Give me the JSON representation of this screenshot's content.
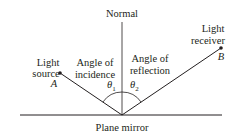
{
  "diagram": {
    "normal_label": "Normal",
    "mirror_label": "Plane mirror",
    "source_label_line1": "Light",
    "source_label_line2": "source",
    "receiver_label_line1": "Light",
    "receiver_label_line2": "receiver",
    "incidence_label_line1": "Angle of",
    "incidence_label_line2": "incidence",
    "reflection_label_line1": "Angle of",
    "reflection_label_line2": "reflection",
    "point_a": "A",
    "point_b": "B",
    "theta1": "θ",
    "theta1_sub": "1",
    "theta2": "θ",
    "theta2_sub": "2",
    "line_color": "#231f20"
  }
}
